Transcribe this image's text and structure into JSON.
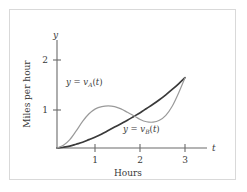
{
  "figure": {
    "background_color": "#ffffff",
    "frame_color": "#d9d9d9"
  },
  "chart_data": {
    "type": "line",
    "title": "",
    "xlabel": "Hours",
    "ylabel": "Miles per hour",
    "x_axis_symbol": "t",
    "y_axis_symbol": "y",
    "xlim": [
      0,
      3.35
    ],
    "ylim": [
      0,
      2.4
    ],
    "xticks": [
      1,
      2,
      3
    ],
    "xticklabels": [
      "1",
      "2",
      "3"
    ],
    "yticks": [
      1,
      2
    ],
    "yticklabels": [
      "1",
      "2"
    ],
    "grid": false,
    "legend": "inline-annotations",
    "series": [
      {
        "name": "v_A",
        "label_prefix": "y = ",
        "label_base": "v",
        "label_sub": "A",
        "label_suffix": "(t)",
        "color": "#9a9a9a",
        "linewidth": 1.2,
        "description": "Rises steeply, local max about 1.10 near t=1.2, local min about 0.68 near t=2.1, then rises to 1.85 at t=3",
        "x": [
          0.0,
          0.15,
          0.3,
          0.45,
          0.6,
          0.75,
          0.9,
          1.05,
          1.2,
          1.35,
          1.5,
          1.65,
          1.8,
          1.95,
          2.1,
          2.25,
          2.4,
          2.55,
          2.7,
          2.85,
          3.0
        ],
        "y": [
          0.0,
          0.07,
          0.22,
          0.45,
          0.7,
          0.9,
          1.03,
          1.09,
          1.11,
          1.09,
          1.03,
          0.94,
          0.85,
          0.75,
          0.69,
          0.68,
          0.73,
          0.86,
          1.1,
          1.45,
          1.85
        ]
      },
      {
        "name": "v_B",
        "label_prefix": "y = ",
        "label_base": "v",
        "label_sub": "B",
        "label_suffix": "(t)",
        "color": "#3a3a3a",
        "linewidth": 1.7,
        "description": "Smooth convex increasing curve from origin to 1.85 at t=3",
        "x": [
          0.0,
          0.15,
          0.3,
          0.45,
          0.6,
          0.75,
          0.9,
          1.05,
          1.2,
          1.35,
          1.5,
          1.65,
          1.8,
          1.95,
          2.1,
          2.25,
          2.4,
          2.55,
          2.7,
          2.85,
          3.0
        ],
        "y": [
          0.0,
          0.02,
          0.05,
          0.1,
          0.15,
          0.22,
          0.29,
          0.37,
          0.46,
          0.55,
          0.64,
          0.73,
          0.83,
          0.93,
          1.04,
          1.15,
          1.27,
          1.4,
          1.54,
          1.69,
          1.85
        ]
      }
    ],
    "annotations": [
      {
        "name": "curve-a-label",
        "text": "y = v_A(t)",
        "x": 1.18,
        "y": 1.62
      },
      {
        "name": "curve-b-label",
        "text": "y = v_B(t)",
        "x": 2.3,
        "y": 0.42
      }
    ],
    "intersections": [
      {
        "x": 2.0,
        "y": 0.82
      }
    ]
  }
}
